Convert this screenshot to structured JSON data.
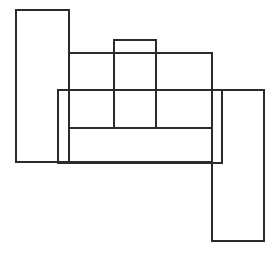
{
  "diagram": {
    "width": 279,
    "height": 253,
    "stroke_color": "#2b2b2b",
    "background": "#ffffff",
    "stroke_width": 2,
    "rectangles": [
      {
        "id": "tall-left",
        "x": 16,
        "y": 10,
        "w": 53,
        "h": 152
      },
      {
        "id": "small-top",
        "x": 114,
        "y": 40,
        "w": 42,
        "h": 88
      },
      {
        "id": "middle-band",
        "x": 69,
        "y": 53,
        "w": 143,
        "h": 75
      },
      {
        "id": "wide",
        "x": 58,
        "y": 90,
        "w": 164,
        "h": 73
      },
      {
        "id": "bottom-band",
        "x": 69,
        "y": 128,
        "w": 143,
        "h": 34
      },
      {
        "id": "tall-right",
        "x": 212,
        "y": 90,
        "w": 52,
        "h": 151
      }
    ]
  }
}
